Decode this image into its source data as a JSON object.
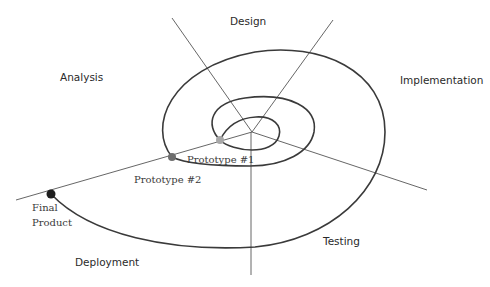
{
  "diagram": {
    "type": "spiral-model",
    "phases": {
      "analysis": "Analysis",
      "design": "Design",
      "implementation": "Implementation",
      "testing": "Testing",
      "deployment": "Deployment"
    },
    "milestones": [
      {
        "label": "Prototype #1",
        "color": "#a8a8a8"
      },
      {
        "label": "Prototype #2",
        "color": "#6e6e6e"
      },
      {
        "label_line1": "Final",
        "label_line2": "Product",
        "color": "#1e1e1e"
      }
    ],
    "colors": {
      "spiral": "#3a3a3a",
      "axis": "#555555",
      "text": "#2a2a2a"
    }
  }
}
